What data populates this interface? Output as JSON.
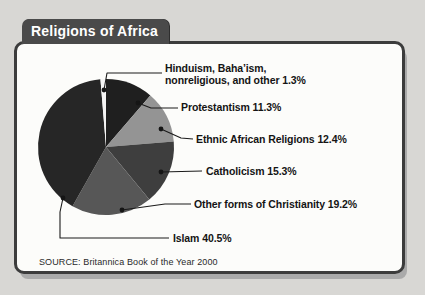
{
  "window": {
    "background_color": "#d8d7d4"
  },
  "figure": {
    "title": "Religions of Africa",
    "source": "SOURCE: Britannica Book of the Year 2000",
    "colors": {
      "tab_bg": "#4a4a4a",
      "tab_text": "#ffffff",
      "panel_border": "#3c3c3c",
      "panel_bg": "#fcfcfa",
      "leader_line": "#1a1a1a"
    }
  },
  "chart_data": {
    "type": "pie",
    "title": "Religions of Africa",
    "source": "SOURCE: Britannica Book of the Year 2000",
    "start_angle_deg": 0,
    "direction": "clockwise",
    "legend_position": "right-callouts",
    "slices": [
      {
        "name": "protestantism",
        "label": "Protestantism",
        "value": 11.3,
        "display": "Protestantism 11.3%",
        "color": "#1f1f1f"
      },
      {
        "name": "ethnic-african-religions",
        "label": "Ethnic African Religions",
        "value": 12.4,
        "display": "Ethnic African Religions 12.4%",
        "color": "#949494"
      },
      {
        "name": "catholicism",
        "label": "Catholicism",
        "value": 15.3,
        "display": "Catholicism 15.3%",
        "color": "#3e3e3e"
      },
      {
        "name": "other-christianity",
        "label": "Other forms of Christianity",
        "value": 19.2,
        "display": "Other forms of Christianity 19.2%",
        "color": "#575757"
      },
      {
        "name": "islam",
        "label": "Islam",
        "value": 40.5,
        "display": "Islam 40.5%",
        "color": "#262626"
      },
      {
        "name": "hinduism-bahaism-nonreligious-other",
        "label": "Hinduism, Baha’ism, nonreligious, and other",
        "value": 1.3,
        "display": "Hinduism, Baha’ism, nonreligious, and other 1.3%",
        "display_lines": [
          "Hinduism, Baha’ism,",
          "nonreligious, and other 1.3%"
        ],
        "color": "#f4f4f4"
      }
    ]
  }
}
